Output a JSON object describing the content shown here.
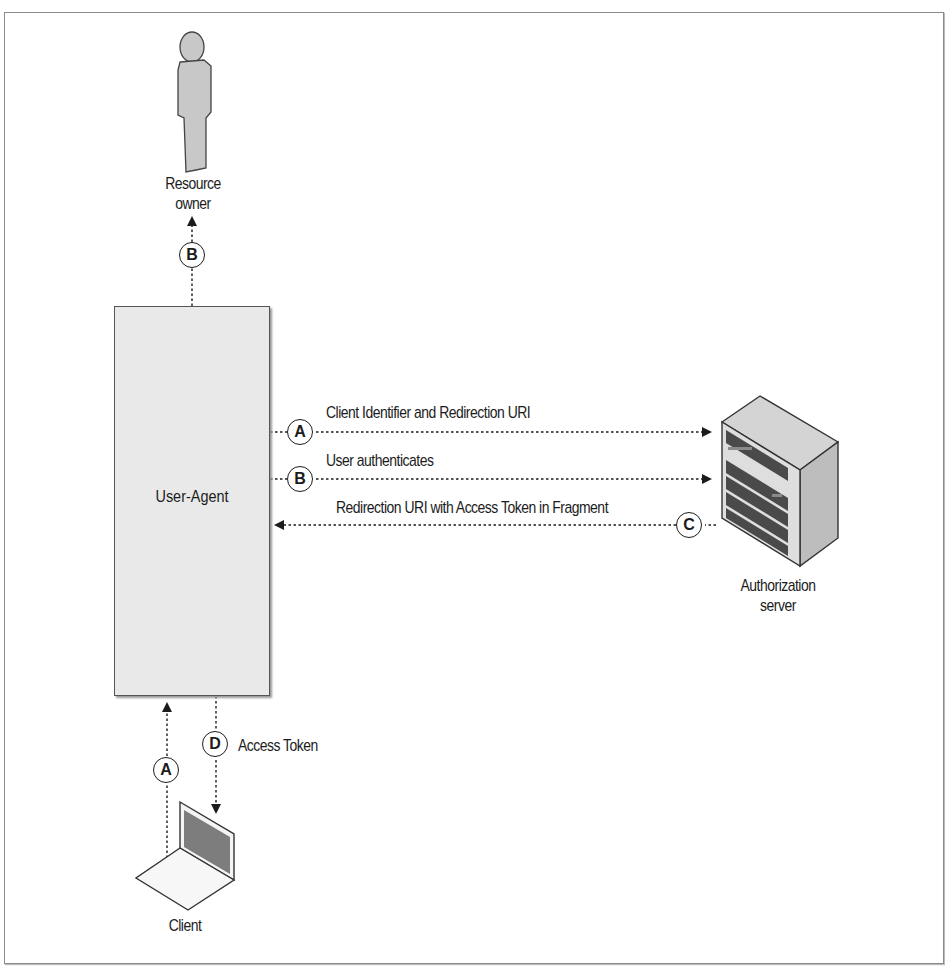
{
  "diagram": {
    "type": "oauth2-implicit-grant-flow",
    "actors": {
      "resource_owner": {
        "label_line1": "Resource",
        "label_line2": "owner",
        "icon": "person-icon"
      },
      "user_agent": {
        "label": "User-Agent"
      },
      "authorization_server": {
        "label_line1": "Authorization",
        "label_line2": "server",
        "icon": "server-rack-icon"
      },
      "client": {
        "label": "Client",
        "icon": "laptop-icon"
      }
    },
    "flows": [
      {
        "step": "A",
        "from": "Client",
        "to": "User-Agent",
        "label": ""
      },
      {
        "step": "A",
        "from": "User-Agent",
        "to": "Authorization server",
        "label": "Client Identifier and Redirection URI"
      },
      {
        "step": "B",
        "from": "User-Agent",
        "to": "Resource owner",
        "label": ""
      },
      {
        "step": "B",
        "from": "User-Agent",
        "to": "Authorization server",
        "label": "User authenticates"
      },
      {
        "step": "C",
        "from": "Authorization server",
        "to": "User-Agent",
        "label": "Redirection URI with Access Token in Fragment"
      },
      {
        "step": "D",
        "from": "User-Agent",
        "to": "Client",
        "label": "Access Token"
      }
    ],
    "colors": {
      "ink": "#1c1c1c",
      "box_fill": "#e9e9e9",
      "icon_fill": "#c8c8c8",
      "dark_slot": "#4a4a4a"
    }
  }
}
